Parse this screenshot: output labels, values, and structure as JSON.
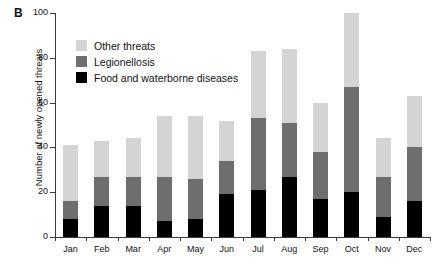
{
  "panel_letter": "B",
  "chart_data": {
    "type": "bar",
    "subtype": "stacked",
    "title": "",
    "xlabel": "",
    "ylabel": "Number of newly opened threats",
    "ylim": [
      0,
      100
    ],
    "yticks": [
      0,
      20,
      40,
      60,
      80,
      100
    ],
    "grid": false,
    "legend_position": "upper-left-inside",
    "categories": [
      "Jan",
      "Feb",
      "Mar",
      "Apr",
      "May",
      "Jun",
      "Jul",
      "Aug",
      "Sep",
      "Oct",
      "Nov",
      "Dec"
    ],
    "series": [
      {
        "name": "Food and waterborne diseases",
        "color": "#000000",
        "values": [
          8,
          14,
          14,
          7,
          8,
          19,
          21,
          27,
          17,
          20,
          9,
          16
        ]
      },
      {
        "name": "Legionellosis",
        "color": "#6e6e6e",
        "values": [
          8,
          13,
          13,
          20,
          18,
          15,
          32,
          24,
          21,
          47,
          18,
          24
        ]
      },
      {
        "name": "Other threats",
        "color": "#d4d4d4",
        "values": [
          25,
          16,
          17,
          27,
          28,
          18,
          30,
          33,
          22,
          33,
          17,
          23
        ]
      }
    ],
    "totals": [
      41,
      43,
      44,
      54,
      54,
      52,
      83,
      84,
      60,
      100,
      44,
      63
    ],
    "legend_order": [
      "Other threats",
      "Legionellosis",
      "Food and waterborne diseases"
    ]
  },
  "legend": {
    "items": [
      {
        "label": "Other threats",
        "color": "#d4d4d4"
      },
      {
        "label": "Legionellosis",
        "color": "#6e6e6e"
      },
      {
        "label": "Food and waterborne diseases",
        "color": "#000000"
      }
    ]
  }
}
